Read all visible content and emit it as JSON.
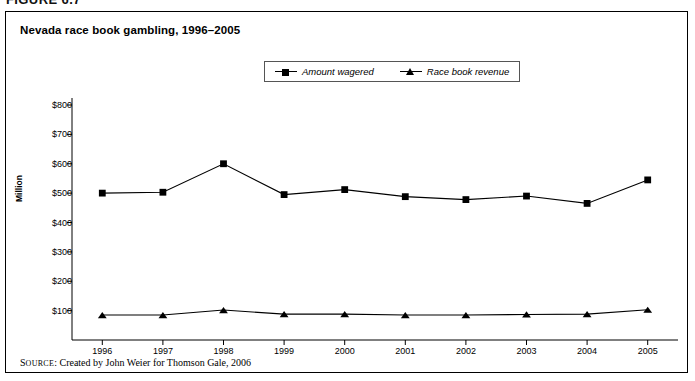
{
  "figure": {
    "number_label": "FIGURE 6.7"
  },
  "chart_title": "Nevada race book gambling, 1996–2005",
  "legend": {
    "position": "top-center",
    "entries": [
      {
        "label": "Amount wagered",
        "marker": "square-marker-icon"
      },
      {
        "label": "Race book revenue",
        "marker": "triangle-marker-icon"
      }
    ]
  },
  "source": {
    "label_small_caps": "OURCE",
    "label_first": "S",
    "text": ": Created by John Weier for Thomson Gale, 2006"
  },
  "chart_data": {
    "type": "line",
    "title": "Nevada race book gambling, 1996–2005",
    "xlabel": "",
    "ylabel": "Million",
    "grid": false,
    "legend_position": "top-center",
    "categories": [
      "1996",
      "1997",
      "1998",
      "1999",
      "2000",
      "2001",
      "2002",
      "2003",
      "2004",
      "2005"
    ],
    "ylim": [
      0,
      800
    ],
    "yticks": [
      100,
      200,
      300,
      400,
      500,
      600,
      700,
      800
    ],
    "ytick_labels": [
      "$100",
      "$200",
      "$300",
      "$400",
      "$500",
      "$600",
      "$700",
      "$800"
    ],
    "series": [
      {
        "name": "Amount wagered",
        "marker": "square",
        "color": "#000000",
        "values": [
          500,
          503,
          600,
          495,
          512,
          488,
          478,
          490,
          465,
          545
        ]
      },
      {
        "name": "Race book revenue",
        "marker": "triangle",
        "color": "#000000",
        "values": [
          85,
          85,
          102,
          88,
          88,
          85,
          85,
          87,
          88,
          103
        ]
      }
    ]
  }
}
